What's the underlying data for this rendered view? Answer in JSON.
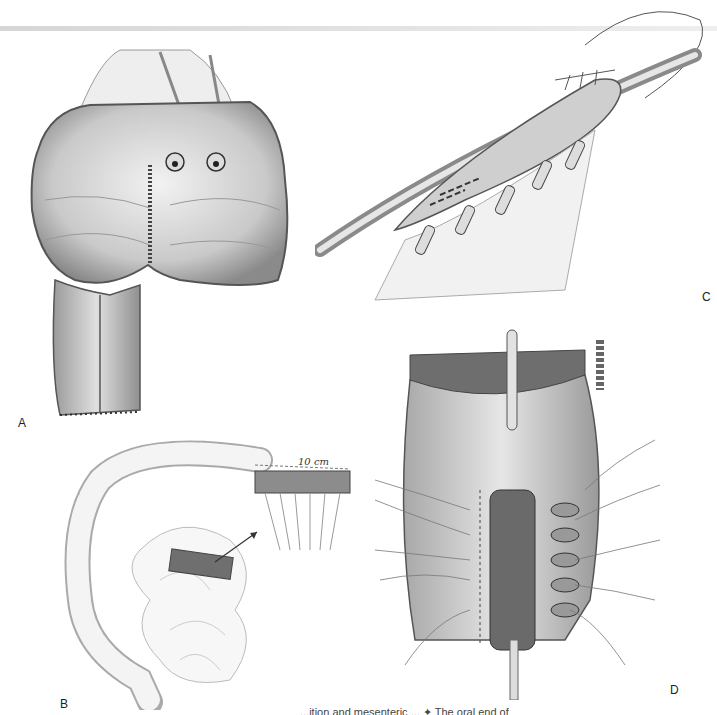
{
  "figure": {
    "panels": [
      {
        "id": "A",
        "label": "A",
        "description": "Opened pouch with longitudinal suture line and two stoma openings above a tubular bowel segment"
      },
      {
        "id": "B",
        "label": "B",
        "description": "Large and small intestine showing selected bowel segment with mesentery",
        "dimension_label": "10 cm"
      },
      {
        "id": "C",
        "label": "C",
        "description": "Bowel segment wrapped and sutured around a catheter"
      },
      {
        "id": "D",
        "label": "D",
        "description": "Reconstructed pouch with catheter through tubularized segment and stay sutures"
      }
    ],
    "caption_fragment": "...ition and mesenteric ... ✦ The oral end of"
  }
}
